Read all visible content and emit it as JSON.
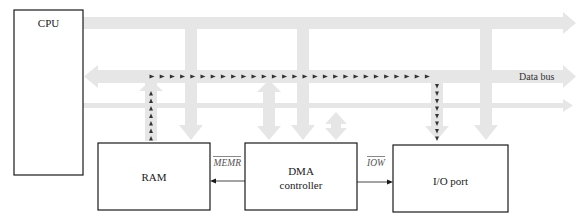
{
  "diagram": {
    "blocks": {
      "cpu": "CPU",
      "ram": "RAM",
      "dma_line1": "DMA",
      "dma_line2": "controller",
      "io": "I/O port"
    },
    "signals": {
      "memr": "MEMR",
      "iow": "IOW"
    },
    "buses": {
      "data_bus_label": "Data bus"
    },
    "data_path": {
      "description": "Data flows from RAM up to the data bus, across, and down to the I/O port",
      "from": "RAM",
      "to": "I/O port"
    },
    "colors": {
      "bus_fill": "#e6e6e6",
      "box_stroke": "#1a1a1a",
      "data_path_marker": "#333333"
    }
  }
}
